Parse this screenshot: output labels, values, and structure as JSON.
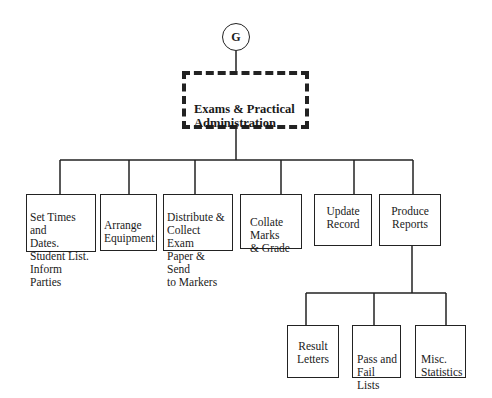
{
  "diagram": {
    "connector": {
      "label": "G"
    },
    "root": {
      "label": "Exams & Practical\n Administration"
    },
    "level1": [
      {
        "id": "set-times",
        "label": "Set Times and\nDates.\nStudent List.\nInform Parties"
      },
      {
        "id": "arrange-equipment",
        "label": "Arrange\nEquipment"
      },
      {
        "id": "distribute-collect",
        "label": "Distribute &\nCollect Exam\nPaper & Send\nto Markers"
      },
      {
        "id": "collate-marks",
        "label": "Collate\nMarks\n& Grade"
      },
      {
        "id": "update-record",
        "label": "Update\nRecord"
      },
      {
        "id": "produce-reports",
        "label": "Produce\nReports"
      }
    ],
    "level2": [
      {
        "id": "result-letters",
        "label": "Result\nLetters"
      },
      {
        "id": "pass-fail-lists",
        "label": "Pass and\nFail  Lists"
      },
      {
        "id": "misc-statistics",
        "label": "Misc.\nStatistics"
      }
    ]
  }
}
